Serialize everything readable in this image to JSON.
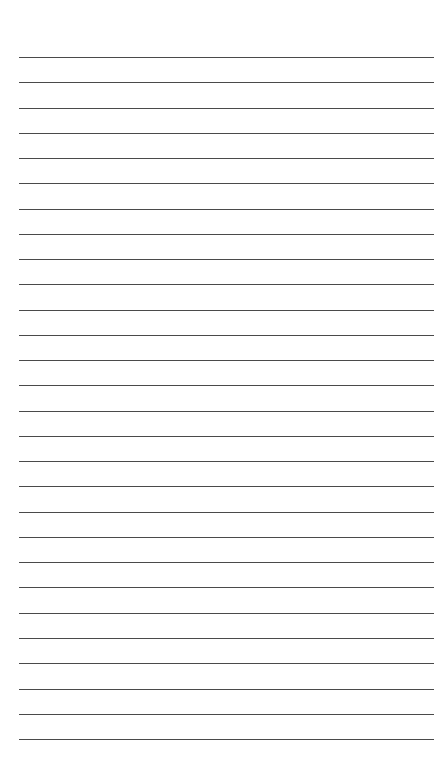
{
  "page": {
    "type": "lined-paper",
    "background_color": "#ffffff",
    "line_color": "#4a4a4a",
    "line_count": 28,
    "first_line_y": 57,
    "last_line_y": 739,
    "line_spacing": 25.26,
    "line_left_x": 19,
    "line_right_x": 434
  }
}
